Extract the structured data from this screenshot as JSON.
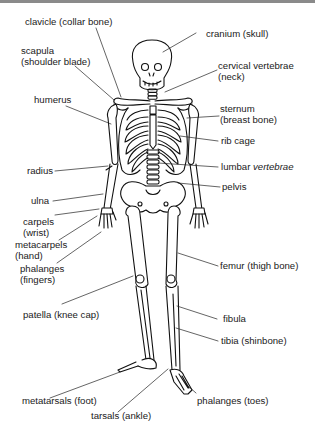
{
  "diagram": {
    "line_color": "#111111",
    "background": "#ffffff",
    "labels": {
      "clavicle": {
        "line1": "clavicle (collar bone)"
      },
      "scapula": {
        "line1": "scapula",
        "line2": "(shoulder blade)"
      },
      "humerus": {
        "line1": "humerus"
      },
      "radius": {
        "line1": "radius"
      },
      "ulna": {
        "line1": "ulna"
      },
      "carpels": {
        "line1": "carpels",
        "line2": "(wrist)"
      },
      "metacarpels": {
        "line1": "metacarpels",
        "line2": "(hand)"
      },
      "phalanges_fingers": {
        "line1": "phalanges",
        "line2": "(fingers)"
      },
      "patella": {
        "line1": "patella (knee cap)"
      },
      "metatarsals": {
        "line1": "metatarsals (foot)"
      },
      "tarsals": {
        "line1": "tarsals (ankle)"
      },
      "cranium": {
        "line1": "cranium (skull)"
      },
      "cervical": {
        "line1": "cervical vertebrae",
        "line2": "(neck)"
      },
      "sternum": {
        "line1": "sternum",
        "line2": "(breast bone)"
      },
      "rib_cage": {
        "line1": "rib cage"
      },
      "lumbar": {
        "word1": "lumbar ",
        "word2": "vertebrae"
      },
      "pelvis": {
        "line1": "pelvis"
      },
      "femur": {
        "line1": "femur (thigh bone)"
      },
      "fibula": {
        "line1": "fibula"
      },
      "tibia": {
        "line1": "tibia (shinbone)"
      },
      "phalanges_toes": {
        "line1": "phalanges (toes)"
      }
    }
  }
}
